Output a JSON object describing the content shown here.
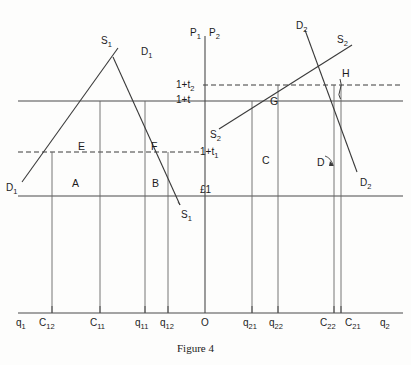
{
  "figure": {
    "caption": "Figure 4",
    "axes": {
      "vertical_left_label": "P",
      "vertical_left_sub": "1",
      "vertical_right_label": "P",
      "vertical_right_sub": "2",
      "horizontal_left_label": "q",
      "horizontal_left_sub": "1",
      "horizontal_right_label": "q",
      "horizontal_right_sub": "2"
    },
    "price_lines": [
      {
        "id": "one-plus-t2",
        "label": "1+t",
        "sub": "2",
        "y": 85,
        "style": "dashed"
      },
      {
        "id": "one-plus-t",
        "label": "1+t",
        "sub": "",
        "y": 101,
        "style": "solid"
      },
      {
        "id": "one-plus-t1",
        "label": "1+t",
        "sub": "1",
        "y": 152,
        "style": "dashed"
      },
      {
        "id": "pound-one",
        "label": "£1",
        "sub": "",
        "y": 196,
        "style": "solid"
      }
    ],
    "x_ticks": [
      {
        "id": "q1",
        "label": "q",
        "sub": "1",
        "x": 22
      },
      {
        "id": "C12",
        "label": "C",
        "sub": "12",
        "x": 52
      },
      {
        "id": "C11",
        "label": "C",
        "sub": "11",
        "x": 100
      },
      {
        "id": "q11",
        "label": "q",
        "sub": "11",
        "x": 145
      },
      {
        "id": "q12",
        "label": "q",
        "sub": "12",
        "x": 168
      },
      {
        "id": "O",
        "label": "O",
        "sub": "",
        "x": 205
      },
      {
        "id": "q21",
        "label": "q",
        "sub": "21",
        "x": 252
      },
      {
        "id": "q22",
        "label": "q",
        "sub": "22",
        "x": 278
      },
      {
        "id": "C22",
        "label": "C",
        "sub": "22",
        "x": 334
      },
      {
        "id": "C21",
        "label": "C",
        "sub": "21",
        "x": 345
      },
      {
        "id": "q2",
        "label": "q",
        "sub": "2",
        "x": 385
      }
    ],
    "curves": [
      {
        "id": "S1",
        "label": "S",
        "sub": "1",
        "role": "supply-left"
      },
      {
        "id": "D1",
        "label": "D",
        "sub": "1",
        "role": "demand-left"
      },
      {
        "id": "S2",
        "label": "S",
        "sub": "2",
        "role": "supply-right"
      },
      {
        "id": "D2",
        "label": "D",
        "sub": "2",
        "role": "demand-right"
      }
    ],
    "curve_labels": [
      {
        "id": "S1-top",
        "label": "S",
        "sub": "1",
        "x": 101,
        "y": 36
      },
      {
        "id": "D1-top",
        "label": "D",
        "sub": "1",
        "x": 141,
        "y": 47
      },
      {
        "id": "D1-left",
        "label": "D",
        "sub": "1",
        "x": 6,
        "y": 183
      },
      {
        "id": "S1-bottom",
        "label": "S",
        "sub": "1",
        "x": 181,
        "y": 210
      },
      {
        "id": "D2-top",
        "label": "D",
        "sub": "2",
        "x": 296,
        "y": 21
      },
      {
        "id": "S2-top",
        "label": "S",
        "sub": "2",
        "x": 337,
        "y": 35
      },
      {
        "id": "S2-mid",
        "label": "S",
        "sub": "2",
        "x": 210,
        "y": 130
      },
      {
        "id": "D2-right",
        "label": "D",
        "sub": "2",
        "x": 360,
        "y": 178
      }
    ],
    "regions": [
      {
        "id": "A",
        "label": "A",
        "x": 72,
        "y": 178
      },
      {
        "id": "B",
        "label": "B",
        "x": 152,
        "y": 178
      },
      {
        "id": "C",
        "label": "C",
        "x": 262,
        "y": 155
      },
      {
        "id": "D",
        "label": "D",
        "x": 317,
        "y": 157
      },
      {
        "id": "E",
        "label": "E",
        "x": 78,
        "y": 141
      },
      {
        "id": "F",
        "label": "F",
        "x": 151,
        "y": 141
      },
      {
        "id": "G",
        "label": "G",
        "x": 270,
        "y": 96
      },
      {
        "id": "H",
        "label": "H",
        "x": 342,
        "y": 72
      }
    ]
  }
}
